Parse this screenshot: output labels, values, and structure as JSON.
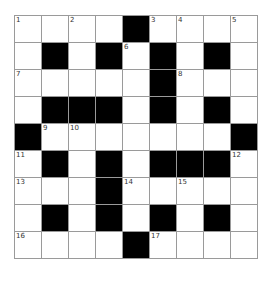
{
  "puzzle": {
    "rows": 9,
    "cols": 9,
    "colors": {
      "black": "#000000",
      "white": "#ffffff",
      "gridline": "#9a9a9a"
    },
    "grid": [
      [
        "1",
        "",
        "2",
        "",
        "#",
        "3",
        "4",
        "",
        "5"
      ],
      [
        "",
        "#",
        "",
        "#",
        "6",
        "#",
        "",
        "#",
        ""
      ],
      [
        "7",
        "",
        "",
        "",
        "",
        "#",
        "8",
        "",
        ""
      ],
      [
        "",
        "#",
        "#",
        "#",
        "",
        "#",
        "",
        "#",
        ""
      ],
      [
        "#",
        "9",
        "10",
        "",
        "",
        "",
        "",
        "",
        "#"
      ],
      [
        "11",
        "#",
        "",
        "#",
        "",
        "#",
        "#",
        "#",
        "12"
      ],
      [
        "13",
        "",
        "",
        "#",
        "14",
        "",
        "15",
        "",
        ""
      ],
      [
        "",
        "#",
        "",
        "#",
        "",
        "#",
        "",
        "#",
        ""
      ],
      [
        "16",
        "",
        "",
        "",
        "#",
        "17",
        "",
        "",
        ""
      ]
    ]
  }
}
